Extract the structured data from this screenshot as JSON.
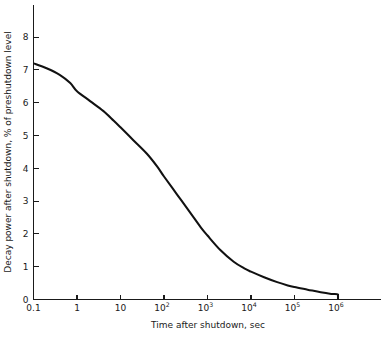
{
  "chart_data": {
    "type": "line",
    "title": "",
    "xlabel": "Time after shutdown, sec",
    "ylabel": "Decay power after shutdown, % of preshutdown level",
    "xscale": "log",
    "yscale": "linear",
    "xlim": [
      0.1,
      1000000
    ],
    "ylim": [
      0,
      8
    ],
    "grid": false,
    "legend": null,
    "xticks": [
      {
        "value": 0.1,
        "label": "0.1",
        "mantissa": "0.1",
        "exponent": ""
      },
      {
        "value": 1,
        "label": "1",
        "mantissa": "1",
        "exponent": ""
      },
      {
        "value": 10,
        "label": "10",
        "mantissa": "10",
        "exponent": ""
      },
      {
        "value": 100,
        "label": "10^2",
        "mantissa": "10",
        "exponent": "2"
      },
      {
        "value": 1000,
        "label": "10^3",
        "mantissa": "10",
        "exponent": "3"
      },
      {
        "value": 10000,
        "label": "10^4",
        "mantissa": "10",
        "exponent": "4"
      },
      {
        "value": 100000,
        "label": "10^5",
        "mantissa": "10",
        "exponent": "5"
      },
      {
        "value": 1000000,
        "label": "10^6",
        "mantissa": "10",
        "exponent": "6"
      }
    ],
    "yticks": [
      {
        "value": 0,
        "label": "0"
      },
      {
        "value": 1,
        "label": "1"
      },
      {
        "value": 2,
        "label": "2"
      },
      {
        "value": 3,
        "label": "3"
      },
      {
        "value": 4,
        "label": "4"
      },
      {
        "value": 5,
        "label": "5"
      },
      {
        "value": 6,
        "label": "6"
      },
      {
        "value": 7,
        "label": "7"
      },
      {
        "value": 8,
        "label": "8"
      }
    ],
    "series": [
      {
        "name": "Decay power",
        "color": "#111111",
        "x": [
          0.1,
          0.2,
          0.4,
          0.7,
          1,
          2,
          4,
          7,
          10,
          20,
          40,
          70,
          100,
          200,
          400,
          700,
          1000,
          2000,
          4000,
          7000,
          10000,
          20000,
          40000,
          70000,
          100000,
          200000,
          400000,
          700000,
          1000000,
          1000000
        ],
        "y": [
          7.2,
          7.05,
          6.85,
          6.6,
          6.35,
          6.05,
          5.75,
          5.45,
          5.25,
          4.85,
          4.45,
          4.05,
          3.75,
          3.2,
          2.65,
          2.2,
          1.95,
          1.5,
          1.15,
          0.95,
          0.85,
          0.68,
          0.53,
          0.43,
          0.38,
          0.3,
          0.22,
          0.17,
          0.15,
          0.0
        ]
      }
    ]
  },
  "axes": {
    "x_title": "Time after shutdown, sec",
    "y_title": "Decay power after shutdown, % of preshutdown level"
  },
  "colors": {
    "curve": "#111111",
    "axis": "#1a1a1a",
    "background": "#ffffff"
  }
}
